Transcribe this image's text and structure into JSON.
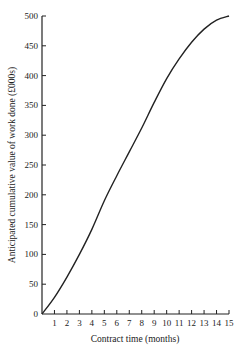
{
  "chart_data": {
    "type": "line",
    "title": "",
    "xlabel": "Contract time (months)",
    "ylabel": "Anticipated cumulative value of work done (£000s)",
    "xlim": [
      0,
      15
    ],
    "ylim": [
      0,
      500
    ],
    "x_ticks": [
      1,
      2,
      3,
      4,
      5,
      6,
      7,
      8,
      9,
      10,
      11,
      12,
      13,
      14,
      15
    ],
    "y_ticks": [
      0,
      50,
      100,
      150,
      200,
      250,
      300,
      350,
      400,
      450,
      500
    ],
    "grid": false,
    "legend": null,
    "series": [
      {
        "name": "Anticipated cumulative value",
        "x": [
          0,
          1,
          2,
          3,
          4,
          5,
          6,
          7,
          8,
          9,
          10,
          11,
          12,
          13,
          14,
          15
        ],
        "values": [
          0,
          28,
          62,
          100,
          142,
          190,
          232,
          272,
          312,
          355,
          395,
          428,
          456,
          478,
          493,
          500
        ]
      }
    ]
  }
}
